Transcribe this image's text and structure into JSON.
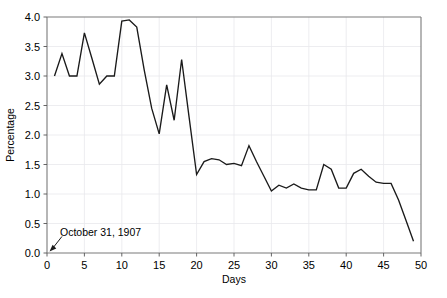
{
  "chart_data": {
    "type": "line",
    "title": "",
    "xlabel": "Days",
    "ylabel": "Percentage",
    "xlim": [
      0,
      50
    ],
    "ylim": [
      0.0,
      4.0
    ],
    "xticks": [
      0,
      5,
      10,
      15,
      20,
      25,
      30,
      35,
      40,
      45,
      50
    ],
    "xtick_labels": [
      "0",
      "5",
      "10",
      "15",
      "20",
      "25",
      "30",
      "35",
      "40",
      "45",
      "50"
    ],
    "yticks": [
      0.0,
      0.5,
      1.0,
      1.5,
      2.0,
      2.5,
      3.0,
      3.5,
      4.0
    ],
    "ytick_labels": [
      "0.0",
      "0.5",
      "1.0",
      "1.5",
      "2.0",
      "2.5",
      "3.0",
      "3.5",
      "4.0"
    ],
    "grid": true,
    "grid_axis": "both",
    "legend": false,
    "legend_position": "none",
    "line_color": "#1a1a1a",
    "series": [
      {
        "name": "Percentage",
        "x": [
          1,
          2,
          3,
          4,
          5,
          6,
          7,
          8,
          9,
          10,
          11,
          12,
          13,
          14,
          15,
          16,
          17,
          18,
          19,
          20,
          21,
          22,
          23,
          24,
          25,
          26,
          27,
          28,
          29,
          30,
          31,
          32,
          33,
          34,
          35,
          36,
          37,
          38,
          39,
          40,
          41,
          42,
          43,
          44,
          45,
          46,
          47,
          48,
          49
        ],
        "y": [
          3.0,
          3.38,
          3.0,
          3.0,
          3.73,
          3.3,
          2.86,
          3.0,
          3.0,
          3.93,
          3.95,
          3.83,
          3.1,
          2.45,
          2.02,
          2.85,
          2.25,
          3.28,
          2.3,
          1.33,
          1.55,
          1.6,
          1.58,
          1.5,
          1.52,
          1.48,
          1.82,
          1.55,
          1.3,
          1.05,
          1.15,
          1.1,
          1.17,
          1.1,
          1.07,
          1.07,
          1.5,
          1.42,
          1.1,
          1.1,
          1.35,
          1.42,
          1.3,
          1.2,
          1.18,
          1.18,
          0.9,
          0.55,
          0.2
        ]
      }
    ],
    "annotations": [
      {
        "text": "October 31, 1907",
        "text_x": 2.0,
        "text_y": 0.28,
        "point_x": 0.0,
        "point_y": 0.0
      }
    ]
  }
}
